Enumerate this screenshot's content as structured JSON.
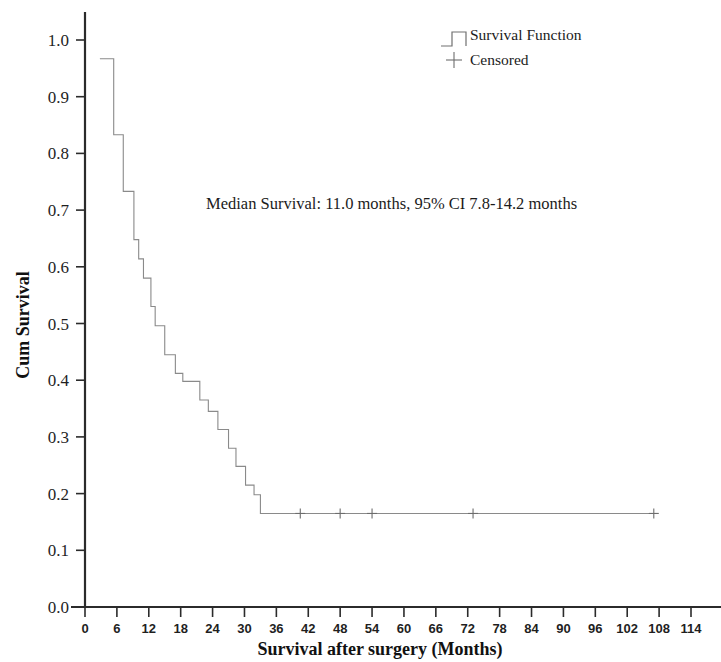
{
  "chart_data": {
    "type": "line",
    "title": "",
    "subtitle": "",
    "xlabel": "Survival after surgery (Months)",
    "ylabel": "Cum Survival",
    "xlim": [
      0,
      114
    ],
    "ylim": [
      0.0,
      1.0
    ],
    "grid": false,
    "legend_position": "top-right",
    "annotations": [
      {
        "name": "median-survival-note",
        "text": "Median Survival: 11.0 months, 95% CI 7.8-14.2 months",
        "x": 30,
        "y": 0.71
      }
    ],
    "legend": [
      {
        "label": "Survival Function",
        "marker": "step-line",
        "color": "#8a8a8a"
      },
      {
        "label": "Censored",
        "marker": "plus",
        "color": "#6d6d6d"
      }
    ],
    "xticks": [
      0,
      6,
      12,
      18,
      24,
      30,
      36,
      42,
      48,
      54,
      60,
      66,
      72,
      78,
      84,
      90,
      96,
      102,
      108,
      114
    ],
    "yticks": [
      0.0,
      0.1,
      0.2,
      0.3,
      0.4,
      0.5,
      0.6,
      0.7,
      0.8,
      0.9,
      1.0
    ],
    "xtick_labels": [
      "0",
      "6",
      "12",
      "18",
      "24",
      "30",
      "36",
      "42",
      "48",
      "54",
      "60",
      "66",
      "72",
      "78",
      "84",
      "90",
      "96",
      "102",
      "108",
      "114"
    ],
    "ytick_labels": [
      "0.0",
      "0.1",
      "0.2",
      "0.3",
      "0.4",
      "0.5",
      "0.6",
      "0.7",
      "0.8",
      "0.9",
      "1.0"
    ],
    "series": [
      {
        "name": "Survival Function",
        "type": "kaplan-meier-step",
        "color": "#8a8a8a",
        "points": [
          {
            "x": 2.8,
            "y": 0.967
          },
          {
            "x": 5.4,
            "y": 0.967
          },
          {
            "x": 5.4,
            "y": 0.833
          },
          {
            "x": 7.2,
            "y": 0.833
          },
          {
            "x": 7.2,
            "y": 0.733
          },
          {
            "x": 9.2,
            "y": 0.733
          },
          {
            "x": 9.2,
            "y": 0.648
          },
          {
            "x": 10.1,
            "y": 0.648
          },
          {
            "x": 10.1,
            "y": 0.614
          },
          {
            "x": 11.0,
            "y": 0.614
          },
          {
            "x": 11.0,
            "y": 0.58
          },
          {
            "x": 12.4,
            "y": 0.58
          },
          {
            "x": 12.4,
            "y": 0.53
          },
          {
            "x": 13.2,
            "y": 0.53
          },
          {
            "x": 13.2,
            "y": 0.496
          },
          {
            "x": 15.0,
            "y": 0.496
          },
          {
            "x": 15.0,
            "y": 0.445
          },
          {
            "x": 17.0,
            "y": 0.445
          },
          {
            "x": 17.0,
            "y": 0.412
          },
          {
            "x": 18.4,
            "y": 0.412
          },
          {
            "x": 18.4,
            "y": 0.398
          },
          {
            "x": 21.6,
            "y": 0.398
          },
          {
            "x": 21.6,
            "y": 0.365
          },
          {
            "x": 23.2,
            "y": 0.365
          },
          {
            "x": 23.2,
            "y": 0.345
          },
          {
            "x": 25.0,
            "y": 0.345
          },
          {
            "x": 25.0,
            "y": 0.313
          },
          {
            "x": 27.0,
            "y": 0.313
          },
          {
            "x": 27.0,
            "y": 0.28
          },
          {
            "x": 28.4,
            "y": 0.28
          },
          {
            "x": 28.4,
            "y": 0.248
          },
          {
            "x": 30.2,
            "y": 0.248
          },
          {
            "x": 30.2,
            "y": 0.215
          },
          {
            "x": 31.8,
            "y": 0.215
          },
          {
            "x": 31.8,
            "y": 0.198
          },
          {
            "x": 33.0,
            "y": 0.198
          },
          {
            "x": 33.0,
            "y": 0.165
          },
          {
            "x": 107.0,
            "y": 0.165
          }
        ]
      },
      {
        "name": "Censored",
        "type": "censor-markers",
        "color": "#6d6d6d",
        "points": [
          {
            "x": 40.5,
            "y": 0.165
          },
          {
            "x": 48.0,
            "y": 0.165
          },
          {
            "x": 54.0,
            "y": 0.165
          },
          {
            "x": 73.0,
            "y": 0.165
          },
          {
            "x": 107.0,
            "y": 0.165
          }
        ]
      }
    ]
  },
  "legend": {
    "survival_label": "Survival Function",
    "censored_label": "Censored"
  },
  "axes": {
    "y_title": "Cum Survival",
    "x_title": "Survival after surgery (Months)"
  },
  "annotation": {
    "median_text": "Median Survival: 11.0 months, 95% CI 7.8-14.2 months"
  },
  "colors": {
    "curve": "#8a8a8a",
    "censor": "#6d6d6d",
    "axis": "#2b2b2b",
    "text": "#1b1b1b",
    "background": "#ffffff"
  }
}
